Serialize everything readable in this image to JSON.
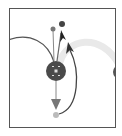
{
  "diagram": {
    "type": "node-link graph",
    "nodes": [
      {
        "id": "center",
        "label": "",
        "color": "#4a4a4a",
        "cx": 56,
        "cy": 71,
        "r": 10
      },
      {
        "id": "top-small",
        "color": "#777777",
        "cx": 53,
        "cy": 29,
        "r": 2.5
      },
      {
        "id": "top-dark",
        "color": "#444444",
        "cx": 62,
        "cy": 24,
        "r": 3
      },
      {
        "id": "bottom-small",
        "color": "#bbbbbb",
        "cx": 56,
        "cy": 115,
        "r": 3
      },
      {
        "id": "right-partial",
        "color": "#555555",
        "cx": 120,
        "cy": 72,
        "r": 7
      }
    ],
    "edges": [
      {
        "from": "left-offscreen",
        "to": "center",
        "style": "curve",
        "color": "#555555"
      },
      {
        "from": "center",
        "to": "top-small",
        "color": "#888888"
      },
      {
        "from": "center",
        "to": "top-dark",
        "color": "#666666",
        "arrow": true
      },
      {
        "from": "center",
        "to": "bottom-small",
        "color": "#888888",
        "arrow": true
      },
      {
        "from": "bottom-small",
        "to": "top-dark",
        "style": "curve",
        "color": "#444444",
        "arrow": true
      },
      {
        "from": "center",
        "to": "right-partial",
        "style": "curve",
        "color": "#e8e8e8",
        "width": 7
      }
    ],
    "center_glyph": "multi-dot"
  }
}
